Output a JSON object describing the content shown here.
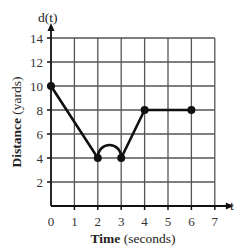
{
  "chart_data": {
    "type": "line",
    "title": "",
    "xlabel": "Time (seconds)",
    "xlabel_bold": "Time",
    "xlabel_rest": " (seconds)",
    "ylabel": "Distance (yards)",
    "ylabel_bold": "Distance",
    "ylabel_rest": " (yards)",
    "x_axis_name": "t",
    "y_axis_name": "d(t)",
    "xlim": [
      0,
      7
    ],
    "ylim": [
      0,
      14
    ],
    "xticks": [
      "0",
      "1",
      "2",
      "3",
      "4",
      "5",
      "6",
      "7"
    ],
    "yticks": [
      "2",
      "4",
      "6",
      "8",
      "10",
      "12",
      "14"
    ],
    "grid": true,
    "series": [
      {
        "name": "d(t)",
        "segments": [
          {
            "type": "line",
            "from": [
              0,
              10
            ],
            "to": [
              2,
              4
            ]
          },
          {
            "type": "arc",
            "from": [
              2,
              4
            ],
            "to": [
              3,
              4
            ],
            "peak": [
              2.5,
              5.2
            ]
          },
          {
            "type": "line",
            "from": [
              3,
              4
            ],
            "to": [
              4,
              8
            ]
          },
          {
            "type": "line",
            "from": [
              4,
              8
            ],
            "to": [
              6,
              8
            ]
          }
        ],
        "points": [
          [
            0,
            10
          ],
          [
            2,
            4
          ],
          [
            3,
            4
          ],
          [
            4,
            8
          ],
          [
            6,
            8
          ]
        ]
      }
    ]
  },
  "colors": {
    "line": "#111111",
    "grid": "#555555",
    "text": "#333333"
  }
}
